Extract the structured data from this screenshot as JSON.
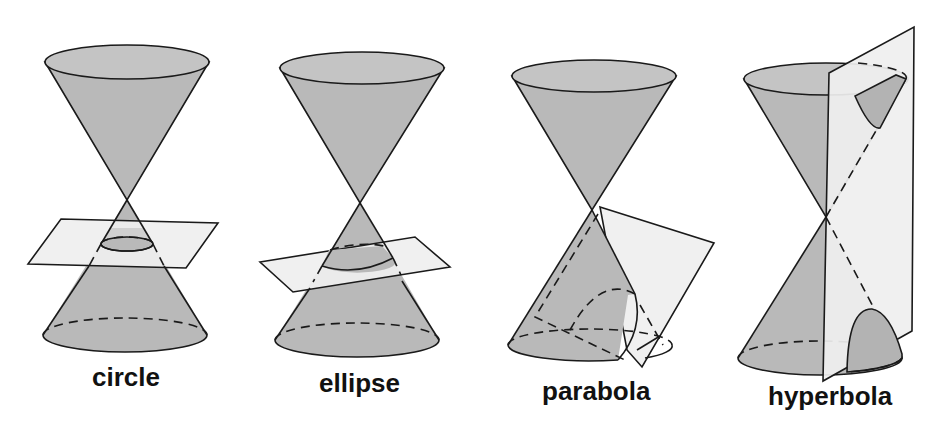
{
  "figure": {
    "colors": {
      "background": "#ffffff",
      "cone_fill": "#b9b9b9",
      "plane_fill": "#efefef",
      "stroke": "#1a1a1a",
      "label": "#111111"
    },
    "panels": [
      {
        "id": "circle",
        "label": "circle",
        "plane_orientation": "horizontal"
      },
      {
        "id": "ellipse",
        "label": "ellipse",
        "plane_orientation": "tilted"
      },
      {
        "id": "parabola",
        "label": "parabola",
        "plane_orientation": "parallel to cone side"
      },
      {
        "id": "hyperbola",
        "label": "hyperbola",
        "plane_orientation": "vertical"
      }
    ]
  }
}
